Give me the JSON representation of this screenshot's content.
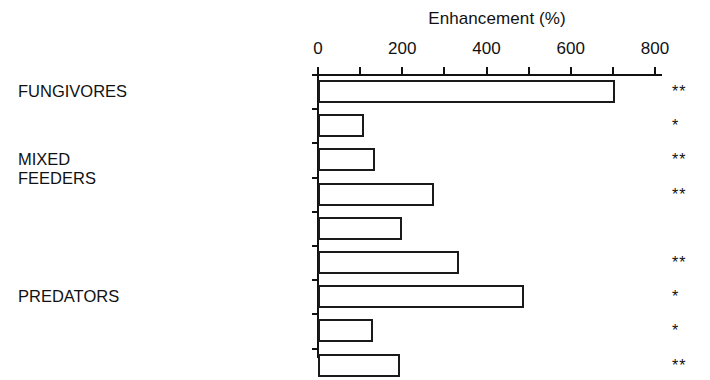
{
  "chart_data": {
    "type": "bar",
    "orientation": "horizontal",
    "title": "",
    "xlabel": "Enhancement (%)",
    "ylabel": "",
    "xlim": [
      0,
      800
    ],
    "grid": false,
    "legend": null,
    "xticks": [
      0,
      200,
      400,
      600,
      800
    ],
    "xtick_labels": [
      "0",
      "200",
      "400",
      "600",
      "800"
    ],
    "minor_tick_step": 100,
    "categories": [
      "Springtails",
      "Fungus gnats",
      "Mites",
      "Staphylinid beetles",
      "Carabid beetle larvae",
      "Hymenoptera",
      "Centipedes",
      "Pseudoscorpions",
      "Spiders"
    ],
    "values": [
      700,
      105,
      130,
      270,
      195,
      330,
      485,
      125,
      190
    ],
    "annotations": [
      "**",
      "*",
      "**",
      "**",
      "",
      "**",
      "*",
      "*",
      "**"
    ],
    "group_labels": [
      {
        "text": "FUNGIVORES",
        "categories": [
          "Springtails",
          "Fungus gnats"
        ]
      },
      {
        "text": "MIXED FEEDERS",
        "categories": [
          "Mites",
          "Staphylinid beetles",
          "Carabid beetle larvae"
        ]
      },
      {
        "text": "PREDATORS",
        "categories": [
          "Hymenoptera",
          "Centipedes",
          "Pseudoscorpions",
          "Spiders"
        ]
      }
    ],
    "bar_facecolor": "#ffffff",
    "bar_edgecolor": "#1a1a1a"
  },
  "axis": {
    "title": "Enhancement (%)",
    "ticks": [
      {
        "label": "0",
        "value": 0
      },
      {
        "label": "200",
        "value": 200
      },
      {
        "label": "400",
        "value": 400
      },
      {
        "label": "600",
        "value": 600
      },
      {
        "label": "800",
        "value": 800
      }
    ]
  },
  "rows": [
    {
      "label": "Springtails",
      "value": 700,
      "sig": "**"
    },
    {
      "label": "Fungus gnats",
      "value": 105,
      "sig": "*"
    },
    {
      "label": "Mites",
      "value": 130,
      "sig": "**"
    },
    {
      "label": "Staphylinid beetles",
      "value": 270,
      "sig": "**"
    },
    {
      "label": "Carabid beetle larvae",
      "value": 195,
      "sig": ""
    },
    {
      "label": "Hymenoptera",
      "value": 330,
      "sig": "**"
    },
    {
      "label": "Centipedes",
      "value": 485,
      "sig": "*"
    },
    {
      "label": "Pseudoscorpions",
      "value": 125,
      "sig": "*"
    },
    {
      "label": "Spiders",
      "value": 190,
      "sig": "**"
    }
  ],
  "groups": [
    {
      "line1": "FUNGIVORES",
      "line2": ""
    },
    {
      "line1": "MIXED",
      "line2": "FEEDERS"
    },
    {
      "line1": "PREDATORS",
      "line2": ""
    }
  ]
}
